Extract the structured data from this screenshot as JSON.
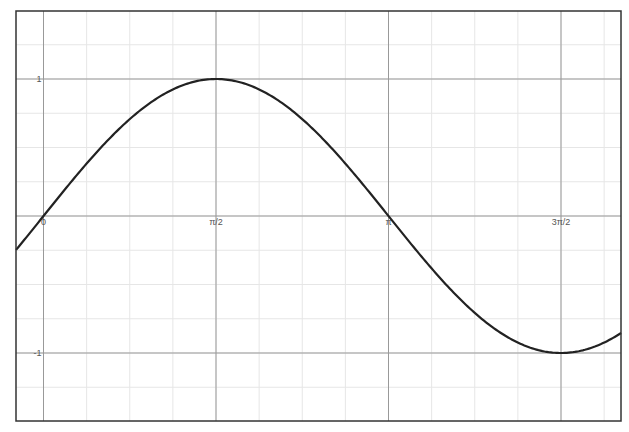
{
  "chart_data": {
    "type": "line",
    "title": "",
    "xlabel": "",
    "ylabel": "",
    "function": "sin(x)",
    "series": [
      {
        "name": "sin(x)",
        "color": "#222222",
        "x": [
          -0.25,
          0,
          0.3927,
          0.7854,
          1.1781,
          1.5708,
          1.9635,
          2.3562,
          2.7489,
          3.1416,
          3.5343,
          3.927,
          4.3197,
          4.7124,
          5.1051,
          5.26
        ],
        "y": [
          -0.247,
          0,
          0.383,
          0.707,
          0.924,
          1,
          0.924,
          0.707,
          0.383,
          0,
          -0.383,
          -0.707,
          -0.924,
          -1,
          -0.924,
          -0.853
        ]
      }
    ],
    "x_ticks": [
      {
        "value": 0,
        "label": "0"
      },
      {
        "value": 1.5708,
        "label": "π/2"
      },
      {
        "value": 3.1416,
        "label": "π"
      },
      {
        "value": 4.7124,
        "label": "3π/2"
      }
    ],
    "y_ticks": [
      {
        "value": 1,
        "label": "1"
      },
      {
        "value": -1,
        "label": "-1"
      }
    ],
    "xlim": [
      -0.25,
      5.26
    ],
    "ylim": [
      -1.49,
      1.5
    ],
    "grid": true,
    "minor_grid": {
      "x_step": 0.3927,
      "y_step": 0.25
    },
    "legend": "none"
  },
  "colors": {
    "frame": "#333333",
    "major_grid": "#999999",
    "minor_grid": "#e6e6e6",
    "curve": "#222222"
  }
}
